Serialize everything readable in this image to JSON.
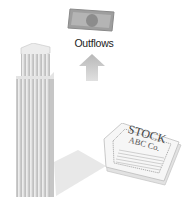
{
  "diagram": {
    "money_icon": "banknote-icon",
    "outflows_label": "Outflows",
    "arrow_icon": "up-arrow-icon",
    "building_icon": "skyscraper-icon",
    "certificate": {
      "title": "STOCK",
      "subtitle": "ABC Co."
    },
    "colors": {
      "banknote": "#9a9a9a",
      "arrow": "#c8c8c8",
      "building": "#d6d6d6",
      "shadow": "#e6e6e6",
      "text": "#222222"
    }
  }
}
